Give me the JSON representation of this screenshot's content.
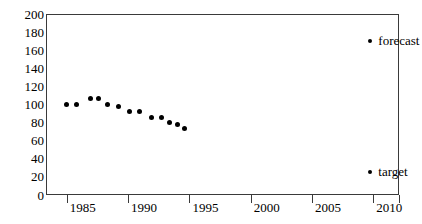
{
  "chart_data": {
    "type": "scatter",
    "title": "",
    "xlabel": "",
    "ylabel": "",
    "xlim": [
      1983.3,
      2012.1
    ],
    "ylim": [
      0,
      200
    ],
    "grid": false,
    "legend_position": "inside-right",
    "xticks": [
      "1985",
      "1990",
      "1995",
      "2000",
      "2005",
      "2010"
    ],
    "xtick_values": [
      1985,
      1990,
      1995,
      2000,
      2005,
      2010
    ],
    "yticks": [
      "0",
      "20",
      "40",
      "60",
      "80",
      "100",
      "120",
      "140",
      "160",
      "180",
      "200"
    ],
    "ytick_values": [
      0,
      20,
      40,
      60,
      80,
      100,
      120,
      140,
      160,
      180,
      200
    ],
    "series": [
      {
        "name": "forecast",
        "marker": "filled-circle",
        "color": "#000000",
        "x": [
          1985.0,
          1985.8,
          1986.9,
          1987.6,
          1988.3,
          1989.2,
          1990.1,
          1990.9,
          1991.9,
          1992.7,
          1993.4,
          1994.0,
          1994.6
        ],
        "values": [
          100,
          100,
          107,
          107,
          100,
          98,
          92,
          92,
          86,
          86,
          80,
          78,
          73
        ]
      }
    ],
    "legend_entries": [
      {
        "label": "forecast",
        "x": 2009.6,
        "y": 170,
        "color": "#000000"
      },
      {
        "label": "target",
        "x": 2009.6,
        "y": 25,
        "color": "#000000"
      }
    ]
  },
  "axis": {
    "frame_color": "#3a3a3a"
  }
}
